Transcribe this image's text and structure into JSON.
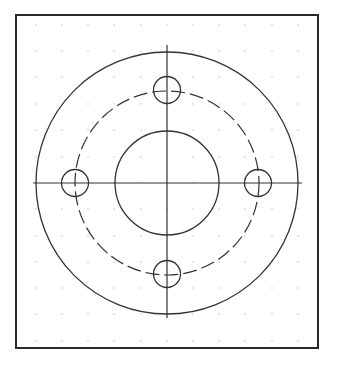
{
  "drawing": {
    "type": "flange-plan-view",
    "colors": {
      "background": "#ffffff",
      "frame": "#2a2a2a",
      "line": "#333333",
      "grid_dot": "#9a9a9a"
    },
    "frame": {
      "x1": 16,
      "y1": 15,
      "x2": 318,
      "y2": 348,
      "stroke_width": 2
    },
    "grid": {
      "columns": [
        36,
        62,
        88,
        114,
        141,
        167,
        193,
        219,
        245,
        272,
        298
      ],
      "rows": [
        25,
        51,
        77,
        104,
        130,
        157,
        183,
        209,
        236,
        262,
        288,
        314,
        341
      ],
      "dot_size": 1
    },
    "center": {
      "x": 167,
      "y": 183
    },
    "outer_circle": {
      "r": 131
    },
    "inner_circle": {
      "r": 52
    },
    "bolt_circle": {
      "r": 92,
      "dash": "14 5"
    },
    "bolt_holes": [
      {
        "name": "top",
        "cx": 167,
        "cy": 90,
        "r": 13.5
      },
      {
        "name": "right",
        "cx": 258,
        "cy": 183,
        "r": 13.5
      },
      {
        "name": "bottom",
        "cx": 167,
        "cy": 274,
        "r": 13.5
      },
      {
        "name": "left",
        "cx": 75,
        "cy": 183,
        "r": 13.5
      }
    ],
    "centerlines": {
      "horizontal": {
        "x1": 33,
        "x2": 302,
        "y": 183
      },
      "vertical": {
        "x": 167,
        "y1": 45,
        "y2": 318
      }
    }
  }
}
